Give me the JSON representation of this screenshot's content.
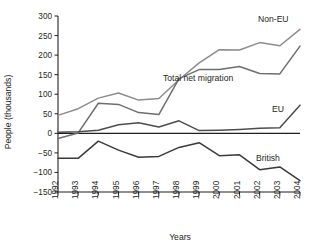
{
  "chart_data": {
    "type": "line",
    "title": "",
    "xlabel": "Years",
    "ylabel": "People (thousands)",
    "categories": [
      "1992",
      "1993",
      "1994",
      "1995",
      "1996",
      "1997",
      "1998",
      "1999",
      "2000",
      "2001",
      "2002",
      "2003",
      "2004"
    ],
    "x": [
      1992,
      1993,
      1994,
      1995,
      1996,
      1997,
      1998,
      1999,
      2000,
      2001,
      2002,
      2003,
      2004
    ],
    "xlim": [
      1992,
      2004
    ],
    "ylim": [
      -150,
      300
    ],
    "yticks": [
      -150,
      -100,
      -50,
      0,
      50,
      100,
      150,
      200,
      250,
      300
    ],
    "ytick_labels": [
      "−150",
      "−100",
      "−50",
      "0",
      "50",
      "100",
      "150",
      "200",
      "250",
      "300"
    ],
    "grid": false,
    "legend": "inline-labels",
    "series": [
      {
        "name": "Non-EU",
        "label": "Non-EU",
        "color": "#8c8c8c",
        "values": [
          46,
          63,
          90,
          103,
          85,
          89,
          137,
          180,
          214,
          213,
          232,
          224,
          266
        ]
      },
      {
        "name": "Total net migration",
        "label": "Total net migration",
        "color": "#6e6e6e",
        "values": [
          -13,
          1,
          77,
          74,
          53,
          48,
          140,
          163,
          163,
          171,
          153,
          152,
          223
        ]
      },
      {
        "name": "EU",
        "label": "EU",
        "color": "#4d4d4d",
        "values": [
          3,
          4,
          8,
          22,
          27,
          16,
          32,
          7,
          8,
          10,
          13,
          14,
          72
        ]
      },
      {
        "name": "British",
        "label": "British",
        "color": "#3a3a3a",
        "values": [
          -64,
          -64,
          -20,
          -43,
          -61,
          -59,
          -36,
          -24,
          -57,
          -55,
          -93,
          -86,
          -121
        ]
      }
    ],
    "series_label_positions": [
      {
        "series": "Non-EU",
        "x": 258,
        "y": 22,
        "anchor": "start"
      },
      {
        "series": "Total net migration",
        "x": 163,
        "y": 81,
        "anchor": "start"
      },
      {
        "series": "EU",
        "x": 272,
        "y": 112,
        "anchor": "start"
      },
      {
        "series": "British",
        "x": 256,
        "y": 161,
        "anchor": "start"
      }
    ]
  }
}
